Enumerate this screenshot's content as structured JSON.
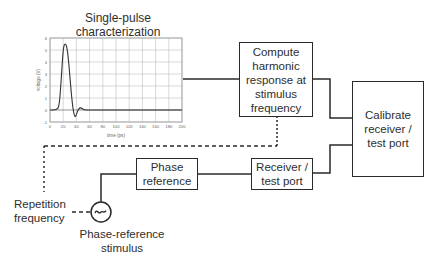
{
  "diagram": {
    "chart_title": "Single-pulse characterization",
    "chart_title_line1": "Single-pulse",
    "chart_title_line2": "characterization",
    "compute_box": {
      "line1": "Compute",
      "line2": "harmonic",
      "line3": "response at",
      "line4": "stimulus",
      "line5": "frequency"
    },
    "calibrate_box": {
      "line1": "Calibrate",
      "line2": "receiver /",
      "line3": "test port"
    },
    "phase_reference_box": {
      "line1": "Phase",
      "line2": "reference"
    },
    "receiver_box": {
      "line1": "Receiver /",
      "line2": "test port"
    },
    "repetition_label": {
      "line1": "Repetition",
      "line2": "frequency"
    },
    "stimulus_label": {
      "line1": "Phase-reference",
      "line2": "stimulus"
    },
    "source_symbol": "~",
    "icons": {
      "source": "ac-source-icon"
    },
    "colors": {
      "line": "#2a2a2a",
      "grid": "#bdbdbd",
      "background": "#ffffff"
    }
  },
  "chart_data": {
    "type": "line",
    "title": "Single-pulse characterization",
    "xlabel": "time (ps)",
    "ylabel": "voltage (V)",
    "xlim": [
      0,
      200
    ],
    "ylim": [
      -1,
      6
    ],
    "xticks": [
      "0",
      "20",
      "40",
      "60",
      "80",
      "100",
      "120",
      "140",
      "160",
      "180",
      "200"
    ],
    "yticks": [
      "-1",
      "0",
      "1",
      "2",
      "3",
      "4",
      "5",
      "6"
    ],
    "grid": true,
    "series": [
      {
        "name": "pulse",
        "x": [
          0,
          10,
          14,
          17,
          20,
          23,
          26,
          29,
          32,
          35,
          38,
          41,
          44,
          47,
          50,
          55,
          60,
          80,
          100,
          150,
          200
        ],
        "values": [
          0,
          0,
          0.3,
          2.5,
          5.2,
          5.6,
          5.2,
          3.6,
          1.5,
          0.0,
          -0.7,
          -0.2,
          0.15,
          0.2,
          0.05,
          0.0,
          0.0,
          0.0,
          0.0,
          0.0,
          0.0
        ]
      }
    ]
  }
}
